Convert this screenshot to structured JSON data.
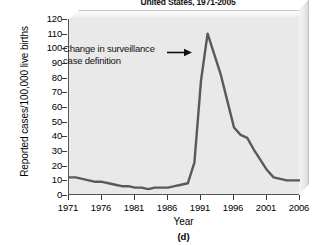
{
  "figure": {
    "title": "United States, 1971-2005",
    "panel_label": "(d)"
  },
  "annotation": {
    "line1": "Change in surveillance",
    "line2": "case definition",
    "arrow_icon": "right-arrow-icon"
  },
  "axes": {
    "y_title": "Reported cases/100,000 live births",
    "x_title": "Year",
    "y_ticks": [
      120,
      110,
      100,
      90,
      80,
      70,
      60,
      50,
      40,
      30,
      20,
      10,
      0
    ],
    "x_ticks": [
      1971,
      1976,
      1981,
      1986,
      1991,
      1996,
      2001,
      2006
    ]
  },
  "colors": {
    "line": "#595959",
    "plot_background": "#e9e9e9",
    "axis": "#555555",
    "text": "#111111"
  },
  "chart_data": {
    "type": "line",
    "title": "United States, 1971-2005",
    "xlabel": "Year",
    "ylabel": "Reported cases/100,000 live births",
    "xlim": [
      1971,
      2006
    ],
    "ylim": [
      0,
      120
    ],
    "grid": false,
    "legend": null,
    "annotations": [
      {
        "text": "Change in surveillance case definition",
        "x": 1991,
        "y": 90,
        "arrow": "points right to the rising limb of the curve"
      }
    ],
    "x": [
      1971,
      1972,
      1973,
      1974,
      1975,
      1976,
      1977,
      1978,
      1979,
      1980,
      1981,
      1982,
      1983,
      1984,
      1985,
      1986,
      1987,
      1988,
      1989,
      1990,
      1991,
      1992,
      1993,
      1994,
      1995,
      1996,
      1997,
      1998,
      1999,
      2000,
      2001,
      2002,
      2003,
      2004,
      2005,
      2006
    ],
    "y": [
      12,
      12,
      11,
      10,
      9,
      9,
      8,
      7,
      6,
      6,
      5,
      5,
      4,
      5,
      5,
      5,
      6,
      7,
      8,
      22,
      78,
      110,
      96,
      82,
      64,
      46,
      41,
      39,
      31,
      24,
      17,
      12,
      11,
      10,
      10,
      10
    ],
    "series": [
      {
        "name": "Reported cases per 100,000 live births",
        "values": [
          12,
          12,
          11,
          10,
          9,
          9,
          8,
          7,
          6,
          6,
          5,
          5,
          4,
          5,
          5,
          5,
          6,
          7,
          8,
          22,
          78,
          110,
          96,
          82,
          64,
          46,
          41,
          39,
          31,
          24,
          17,
          12,
          11,
          10,
          10,
          10
        ]
      }
    ]
  }
}
